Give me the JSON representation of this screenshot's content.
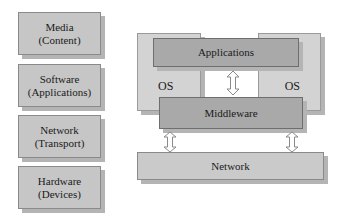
{
  "layers": [
    {
      "title": "Media",
      "subtitle": "(Content)"
    },
    {
      "title": "Software",
      "subtitle": "(Applications)"
    },
    {
      "title": "Network",
      "subtitle": "(Transport)"
    },
    {
      "title": "Hardware",
      "subtitle": "(Devices)"
    }
  ],
  "architecture": {
    "os_left": "OS",
    "os_right": "OS",
    "applications": "Applications",
    "middleware": "Middleware",
    "network": "Network"
  },
  "arrows": [
    {
      "from": "Applications",
      "to": "Middleware",
      "icon": "double-arrow-vertical-icon"
    },
    {
      "from": "Middleware",
      "to": "Network",
      "icon": "double-arrow-vertical-icon"
    },
    {
      "from": "Middleware",
      "to": "Network",
      "icon": "double-arrow-vertical-icon"
    }
  ]
}
